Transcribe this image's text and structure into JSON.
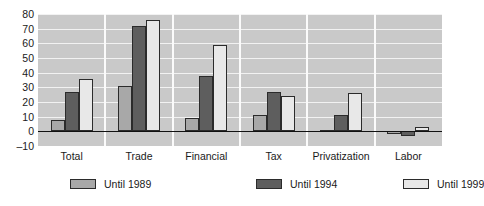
{
  "chart_data": {
    "type": "bar",
    "title": "",
    "subtitle": "",
    "xlabel": "",
    "ylabel": "",
    "ylim": [
      -10,
      80
    ],
    "yticks": [
      80,
      70,
      60,
      50,
      40,
      30,
      20,
      10,
      0,
      -10
    ],
    "ytick_labels": [
      "80",
      "70",
      "60",
      "50",
      "40",
      "30",
      "20",
      "10",
      "0",
      "–10"
    ],
    "grid": true,
    "legend_position": "bottom",
    "categories": [
      "Total",
      "Trade",
      "Financial",
      "Tax",
      "Privatization",
      "Labor"
    ],
    "series": [
      {
        "name": "Until 1989",
        "color": "#a8a8a8",
        "values": [
          8,
          31,
          9,
          11,
          1,
          -2
        ]
      },
      {
        "name": "Until 1994",
        "color": "#5e5e5e",
        "values": [
          27,
          72,
          38,
          27,
          11,
          -3
        ]
      },
      {
        "name": "Until 1999",
        "color": "#e8e8e8",
        "values": [
          36,
          76,
          59,
          24,
          26,
          3
        ]
      }
    ],
    "plot_background": "#c9c9c9",
    "gridline_color": "#f2f2f2",
    "bar_edge_color": "#2b2b2b",
    "zero_line_color": "#111111"
  }
}
